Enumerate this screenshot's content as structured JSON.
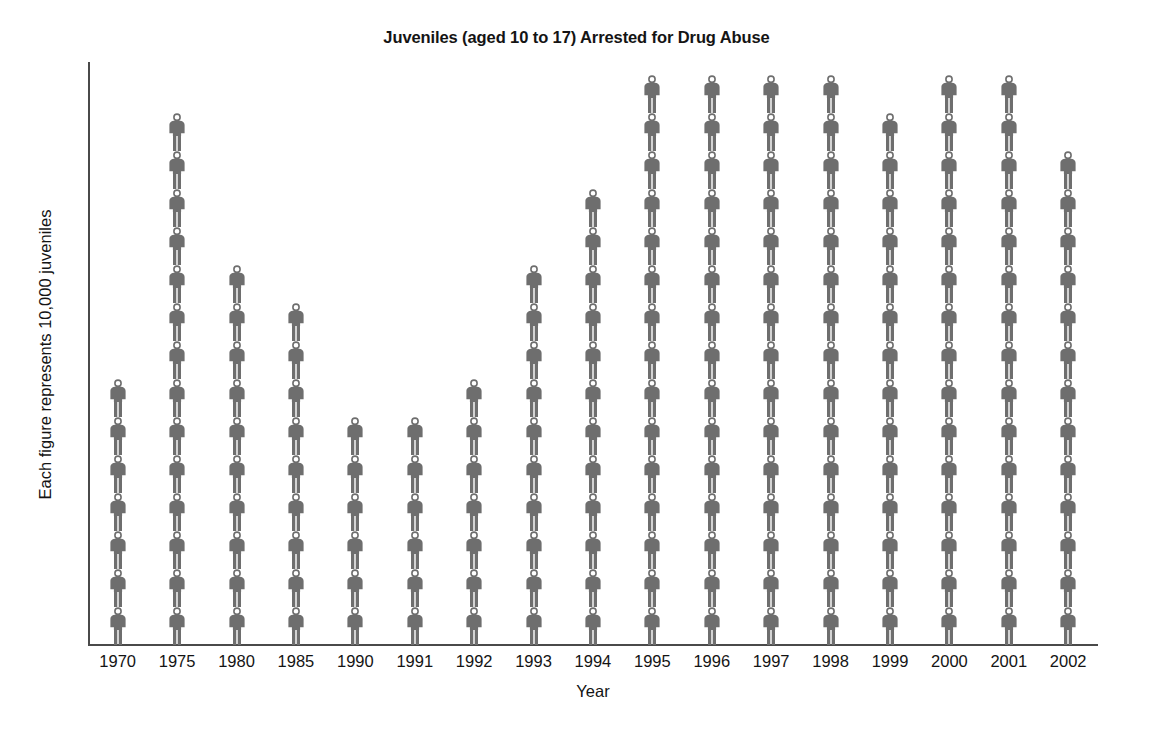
{
  "chart_data": {
    "type": "bar",
    "subtype": "pictogram",
    "title": "Juveniles (aged 10 to 17) Arrested for Drug Abuse",
    "xlabel": "Year",
    "ylabel": "Each figure represents 10,000 juveniles",
    "unit_per_figure": 10000,
    "grid": false,
    "legend": "none",
    "ylim": [
      0,
      15
    ],
    "categories": [
      "1970",
      "1975",
      "1980",
      "1985",
      "1990",
      "1991",
      "1992",
      "1993",
      "1994",
      "1995",
      "1996",
      "1997",
      "1998",
      "1999",
      "2000",
      "2001",
      "2002"
    ],
    "values": [
      7,
      14,
      10,
      9,
      6,
      6,
      7,
      10,
      12,
      15,
      15,
      15,
      15,
      14,
      15,
      15,
      13
    ],
    "values_in_juveniles": [
      70000,
      140000,
      100000,
      90000,
      60000,
      60000,
      70000,
      100000,
      120000,
      150000,
      150000,
      150000,
      150000,
      140000,
      150000,
      150000,
      130000
    ],
    "figure_color": "#6e6e6e",
    "axis_color": "#4a4a4a",
    "text_color": "#141414",
    "background_color": "#ffffff"
  }
}
